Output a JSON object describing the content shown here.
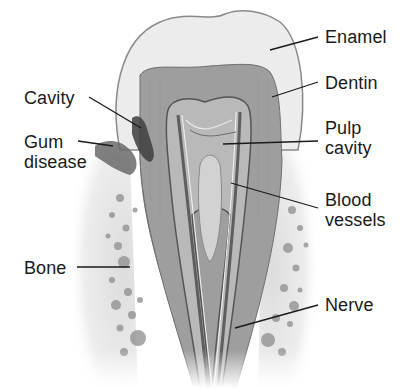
{
  "diagram": {
    "colors": {
      "background": "#ffffff",
      "enamel": "#e9e9e9",
      "enamel_outline": "#8a8a8a",
      "dentin": "#9c9c9c",
      "pulp": "#b8b8b8",
      "canal": "#5e5e5e",
      "root_cementum": "#c4c4c4",
      "bone_bg": "#e4e4e4",
      "bone_spot": "#8d8d8d",
      "gum": "#6a6a6a",
      "leader": "#1a1a1a",
      "text": "#1a1a1a"
    },
    "labels": {
      "enamel": "Enamel",
      "dentin": "Dentin",
      "pulp_cavity": "Pulp\ncavity",
      "blood_vessels": "Blood\nvessels",
      "nerve": "Nerve",
      "cavity": "Cavity",
      "gum_disease": "Gum\ndisease",
      "bone": "Bone"
    }
  }
}
